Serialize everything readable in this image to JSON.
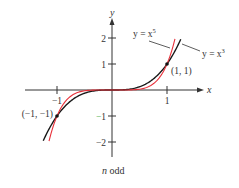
{
  "chart_data": {
    "type": "line",
    "title": "",
    "caption": "n odd",
    "xlabel": "x",
    "ylabel": "y",
    "xlim": [
      -1.4,
      1.6
    ],
    "ylim": [
      -2.6,
      2.6
    ],
    "x_ticks": [
      {
        "value": -1,
        "label": "−1"
      },
      {
        "value": 1,
        "label": "1"
      }
    ],
    "y_ticks": [
      {
        "value": 2,
        "label": "2"
      },
      {
        "value": 1,
        "label": "1"
      },
      {
        "value": -1,
        "label": "−1"
      },
      {
        "value": -2,
        "label": "−2"
      }
    ],
    "grid": false,
    "legend": "annotations",
    "series": [
      {
        "name": "y = x^3",
        "label_text": "y = x",
        "label_exp": "3",
        "color": "#1a1a1a",
        "domain": [
          -1.25,
          1.25
        ],
        "function": "x^3"
      },
      {
        "name": "y = x^5",
        "label_text": "y = x",
        "label_exp": "5",
        "color": "#e8303a",
        "domain": [
          -1.145,
          1.145
        ],
        "function": "x^5"
      }
    ],
    "points": [
      {
        "x": 1,
        "y": 1,
        "label": "(1, 1)"
      },
      {
        "x": -1,
        "y": -1,
        "label": "(−1, −1)"
      }
    ]
  },
  "colors": {
    "axis": "#333333",
    "tick_minus1_accent": "#4caf50"
  }
}
